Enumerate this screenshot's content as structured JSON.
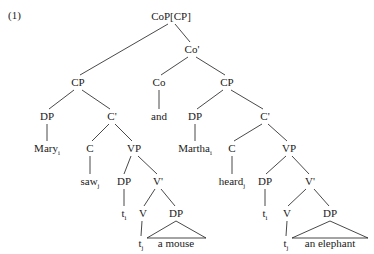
{
  "example": {
    "number": "(1)"
  },
  "figure": {
    "type": "syntax-tree"
  },
  "nodes": {
    "cop": {
      "label": "CoP[CP]",
      "x": 171,
      "y": 16
    },
    "cp_left": {
      "label": "CP",
      "x": 78,
      "y": 82
    },
    "co_bar": {
      "label": "Co'",
      "x": 192,
      "y": 49
    },
    "co_head": {
      "label": "Co",
      "x": 159,
      "y": 82
    },
    "cp_right": {
      "label": "CP",
      "x": 227,
      "y": 82
    },
    "and": {
      "label": "and",
      "x": 159,
      "y": 116
    },
    "dp_left_subj": {
      "label": "DP",
      "x": 47,
      "y": 116
    },
    "c_bar_left": {
      "label": "C'",
      "x": 112,
      "y": 116
    },
    "dp_right_subj": {
      "label": "DP",
      "x": 195,
      "y": 116
    },
    "c_bar_right": {
      "label": "C'",
      "x": 265,
      "y": 116
    },
    "mary": {
      "label": "Mary",
      "sub": "i",
      "x": 47,
      "y": 148
    },
    "c_left": {
      "label": "C",
      "x": 90,
      "y": 148
    },
    "vp_left": {
      "label": "VP",
      "x": 134,
      "y": 148
    },
    "martha": {
      "label": "Martha",
      "sub": "i",
      "x": 195,
      "y": 148
    },
    "c_right": {
      "label": "C",
      "x": 232,
      "y": 148
    },
    "vp_right": {
      "label": "VP",
      "x": 289,
      "y": 148
    },
    "saw": {
      "label": "saw",
      "sub": "j",
      "x": 90,
      "y": 181
    },
    "dp_left_trace_node": {
      "label": "DP",
      "x": 124,
      "y": 181
    },
    "v_bar_left": {
      "label": "V'",
      "x": 158,
      "y": 181
    },
    "heard": {
      "label": "heard",
      "sub": "j",
      "x": 232,
      "y": 181
    },
    "dp_right_trace_node": {
      "label": "DP",
      "x": 265,
      "y": 181
    },
    "v_bar_right": {
      "label": "V'",
      "x": 310,
      "y": 181
    },
    "trace_subj_left": {
      "label": "t",
      "sub": "i",
      "x": 124,
      "y": 213
    },
    "v_left": {
      "label": "V",
      "x": 143,
      "y": 213
    },
    "dp_obj_left": {
      "label": "DP",
      "x": 176,
      "y": 213
    },
    "trace_subj_right": {
      "label": "t",
      "sub": "i",
      "x": 265,
      "y": 213
    },
    "v_right": {
      "label": "V",
      "x": 287,
      "y": 213
    },
    "dp_obj_right": {
      "label": "DP",
      "x": 330,
      "y": 213
    },
    "trace_v_left": {
      "label": "t",
      "sub": "j",
      "x": 141,
      "y": 243
    },
    "a_mouse": {
      "label": "a mouse",
      "x": 176,
      "y": 243
    },
    "trace_v_right": {
      "label": "t",
      "sub": "j",
      "x": 286,
      "y": 243
    },
    "an_elephant": {
      "label": "an elephant",
      "x": 330,
      "y": 243
    }
  },
  "colors": {
    "ink": "#1a1a1a",
    "background": "#ffffff"
  }
}
